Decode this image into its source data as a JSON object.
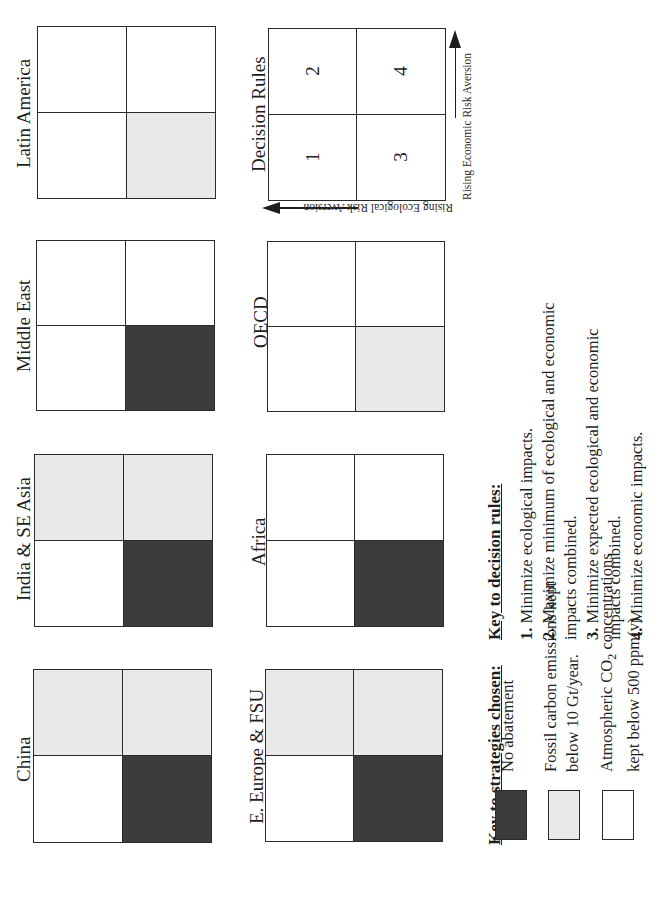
{
  "figure": {
    "orientation": "rotated 90deg counter-clockwise",
    "regions": [
      {
        "id": "latin-america",
        "label": "Latin America",
        "quadrants": {
          "top_left": "white",
          "top_right": "white",
          "bottom_left": "white",
          "bottom_right": "light"
        }
      },
      {
        "id": "middle-east",
        "label": "Middle East",
        "quadrants": {
          "top_left": "white",
          "top_right": "white",
          "bottom_left": "white",
          "bottom_right": "dark"
        }
      },
      {
        "id": "india-se-asia",
        "label": "India & SE Asia",
        "quadrants": {
          "top_left": "light",
          "top_right": "light",
          "bottom_left": "white",
          "bottom_right": "dark"
        }
      },
      {
        "id": "china",
        "label": "China",
        "quadrants": {
          "top_left": "light",
          "top_right": "light",
          "bottom_left": "white",
          "bottom_right": "dark"
        }
      },
      {
        "id": "oecd",
        "label": "OECD",
        "quadrants": {
          "top_left": "white",
          "top_right": "white",
          "bottom_left": "white",
          "bottom_right": "light"
        }
      },
      {
        "id": "africa",
        "label": "Africa",
        "quadrants": {
          "top_left": "white",
          "top_right": "white",
          "bottom_left": "white",
          "bottom_right": "dark"
        }
      },
      {
        "id": "e-europe-fsu",
        "label": "E. Europe & FSU",
        "quadrants": {
          "top_left": "light",
          "top_right": "light",
          "bottom_left": "white",
          "bottom_right": "dark"
        }
      }
    ],
    "decision_rules_grid": {
      "label": "Decision Rules",
      "cells": {
        "top_left": "2",
        "top_right": "4",
        "bottom_left": "1",
        "bottom_right": "3"
      },
      "axis_economic": "Rising Economic Risk Aversion",
      "axis_ecological": "Rising Ecological Risk Aversion"
    },
    "key_decision_rules": {
      "title": "Key to decision rules:",
      "rules": [
        {
          "num": "1.",
          "lines": [
            "Minimize ecological impacts."
          ]
        },
        {
          "num": "2.",
          "lines": [
            "Maximize minimum of ecological and economic",
            "impacts combined."
          ]
        },
        {
          "num": "3.",
          "lines": [
            "Minimize expected ecological and economic",
            "impacts combined."
          ]
        },
        {
          "num": "4.",
          "lines": [
            "Minimize economic impacts."
          ]
        }
      ]
    },
    "key_strategies": {
      "title": "Key to strategies chosen:",
      "items": [
        {
          "fill": "dark",
          "lines": [
            "No abatement"
          ]
        },
        {
          "fill": "light",
          "lines": [
            "Fossil carbon emissions kept",
            "below 10 Gt/year."
          ]
        },
        {
          "fill": "white",
          "lines_html": [
            "Atmospheric CO2 concentrations",
            "kept below 500 ppm(v)"
          ],
          "line1_prefix": "Atmospheric CO",
          "line1_sub": "2",
          "line1_suffix": " concentrations",
          "line2": "kept below 500 ppm(v)"
        }
      ]
    },
    "colors": {
      "dark": "#3c3c3c",
      "light": "#e9e9e9",
      "white": "#ffffff",
      "line": "#2a2a2a"
    }
  }
}
